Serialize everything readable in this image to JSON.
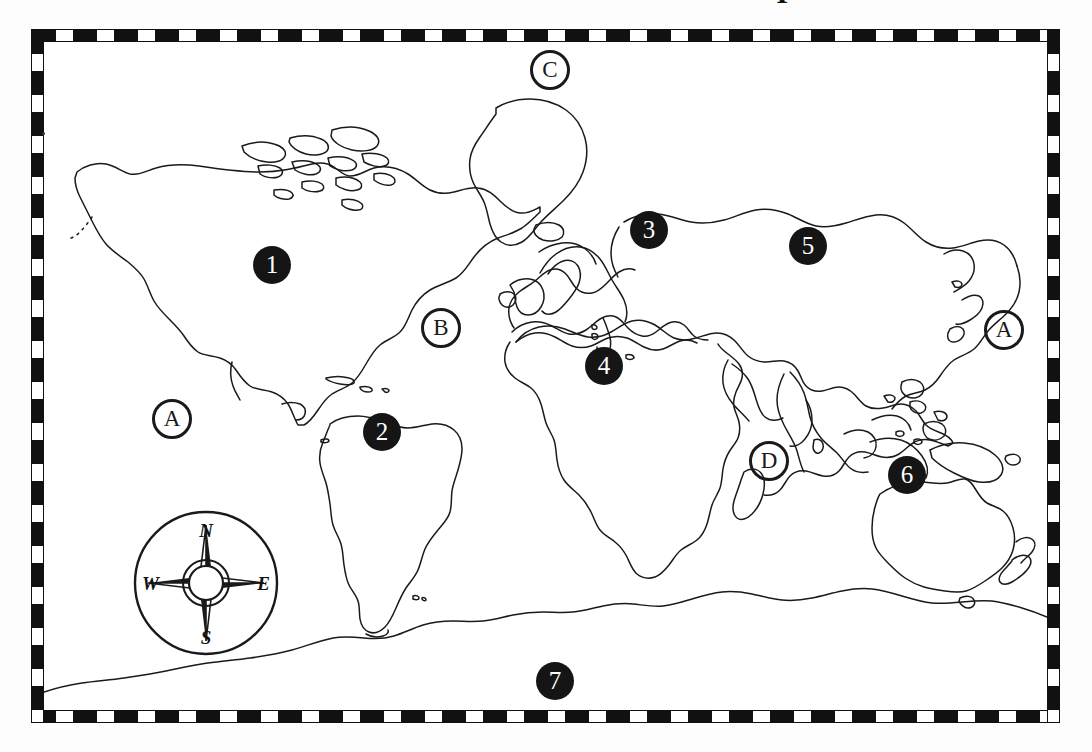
{
  "document": {
    "type": "world-map-worksheet",
    "title_fragment": "I",
    "background_color": "#ffffff",
    "ink_color": "#1a1a1a"
  },
  "map": {
    "projection": "world-outline",
    "border_style": "alternating-black-white-dashed",
    "border_colors": {
      "dark": "#111111",
      "light": "#ffffff"
    }
  },
  "compass": {
    "name": "compass-rose",
    "north": "N",
    "east": "E",
    "south": "S",
    "west": "W"
  },
  "markers": {
    "numbered": [
      {
        "id": "marker-1",
        "label": "1",
        "x": 259,
        "y": 265,
        "region": "North America"
      },
      {
        "id": "marker-2",
        "label": "2",
        "x": 369,
        "y": 432,
        "region": "South America"
      },
      {
        "id": "marker-3",
        "label": "3",
        "x": 636,
        "y": 230,
        "region": "Europe / Russia"
      },
      {
        "id": "marker-4",
        "label": "4",
        "x": 591,
        "y": 366,
        "region": "Africa"
      },
      {
        "id": "marker-5",
        "label": "5",
        "x": 795,
        "y": 246,
        "region": "Asia"
      },
      {
        "id": "marker-6",
        "label": "6",
        "x": 894,
        "y": 475,
        "region": "Australia"
      },
      {
        "id": "marker-7",
        "label": "7",
        "x": 542,
        "y": 681,
        "region": "Antarctica"
      }
    ],
    "lettered": [
      {
        "id": "marker-a-left",
        "label": "A",
        "x": 159,
        "y": 419,
        "region": "Pacific Ocean (east)"
      },
      {
        "id": "marker-b",
        "label": "B",
        "x": 428,
        "y": 328,
        "region": "Atlantic Ocean"
      },
      {
        "id": "marker-c",
        "label": "C",
        "x": 537,
        "y": 70,
        "region": "Arctic Ocean"
      },
      {
        "id": "marker-d",
        "label": "D",
        "x": 756,
        "y": 461,
        "region": "Indian Ocean"
      },
      {
        "id": "marker-a-right",
        "label": "A",
        "x": 991,
        "y": 330,
        "region": "Pacific Ocean (west)"
      }
    ]
  }
}
